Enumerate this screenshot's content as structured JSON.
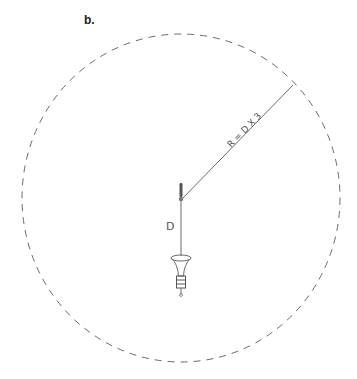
{
  "figure": {
    "panel_label": "b.",
    "radius_label": "R = D X 3",
    "distance_label": "D"
  },
  "colors": {
    "stroke": "#6b6b6b",
    "text": "#555555",
    "background": "#ffffff"
  }
}
